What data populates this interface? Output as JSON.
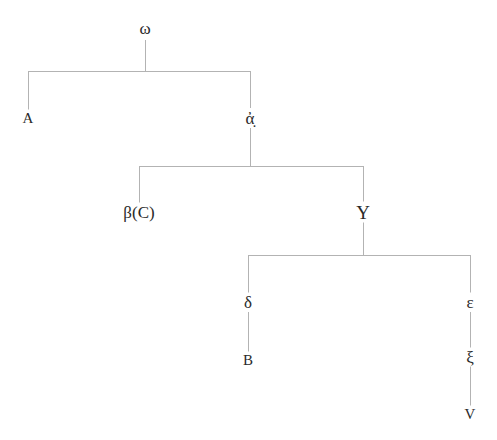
{
  "diagram": {
    "type": "tree",
    "background_color": "#ffffff",
    "line_color": "#b3b3b3",
    "text_color": "#2a2a2a",
    "width": 497,
    "height": 440
  },
  "nodes": [
    {
      "id": "omega",
      "label": "ω",
      "x": 145,
      "y": 28,
      "style": "greek-lower",
      "role": "root-archetype"
    },
    {
      "id": "A",
      "label": "A",
      "x": 28,
      "y": 118,
      "style": "latin-upper",
      "role": "witness"
    },
    {
      "id": "alpha",
      "label": "ἀ̣",
      "x": 250,
      "y": 118,
      "style": "greek-lower",
      "role": "hyparchetype"
    },
    {
      "id": "beta",
      "label": "β(C)",
      "x": 139,
      "y": 212,
      "style": "compound",
      "role": "hyparchetype-witness"
    },
    {
      "id": "upsilon",
      "label": "Υ",
      "x": 363,
      "y": 212,
      "style": "greek-upper",
      "role": "hyparchetype"
    },
    {
      "id": "delta",
      "label": "δ",
      "x": 248,
      "y": 302,
      "style": "greek-lower",
      "role": "hyparchetype"
    },
    {
      "id": "epsilon",
      "label": "ε",
      "x": 470,
      "y": 302,
      "style": "greek-lower",
      "role": "hyparchetype"
    },
    {
      "id": "B",
      "label": "B",
      "x": 248,
      "y": 360,
      "style": "latin-upper",
      "role": "witness"
    },
    {
      "id": "xi",
      "label": "ξ",
      "x": 470,
      "y": 357,
      "style": "greek-lower",
      "role": "hyparchetype"
    },
    {
      "id": "V",
      "label": "V",
      "x": 470,
      "y": 414,
      "style": "latin-upper",
      "role": "witness"
    }
  ],
  "edges": [
    {
      "id": "stem-omega",
      "kind": "vertical",
      "x": 145,
      "y1": 40,
      "y2": 71,
      "from": "omega",
      "to": "bar-1"
    },
    {
      "id": "bar-1",
      "kind": "horizontal",
      "y": 71,
      "x1": 28,
      "x2": 250,
      "from": "omega",
      "to": "A|alpha"
    },
    {
      "id": "drop-A",
      "kind": "vertical",
      "x": 28,
      "y1": 71,
      "y2": 110,
      "from": "bar-1",
      "to": "A"
    },
    {
      "id": "drop-alpha",
      "kind": "vertical",
      "x": 250,
      "y1": 71,
      "y2": 108,
      "from": "bar-1",
      "to": "alpha"
    },
    {
      "id": "stem-alpha",
      "kind": "vertical",
      "x": 250,
      "y1": 128,
      "y2": 166,
      "from": "alpha",
      "to": "bar-2"
    },
    {
      "id": "bar-2",
      "kind": "horizontal",
      "y": 166,
      "x1": 139,
      "x2": 363,
      "from": "alpha",
      "to": "beta|upsilon"
    },
    {
      "id": "drop-beta",
      "kind": "vertical",
      "x": 139,
      "y1": 166,
      "y2": 203,
      "from": "bar-2",
      "to": "beta"
    },
    {
      "id": "drop-upsilon",
      "kind": "vertical",
      "x": 363,
      "y1": 166,
      "y2": 202,
      "from": "bar-2",
      "to": "upsilon"
    },
    {
      "id": "stem-upsilon",
      "kind": "vertical",
      "x": 363,
      "y1": 222,
      "y2": 255,
      "from": "upsilon",
      "to": "bar-3"
    },
    {
      "id": "bar-3",
      "kind": "horizontal",
      "y": 255,
      "x1": 248,
      "x2": 470,
      "from": "upsilon",
      "to": "delta|epsilon"
    },
    {
      "id": "drop-delta",
      "kind": "vertical",
      "x": 248,
      "y1": 255,
      "y2": 293,
      "from": "bar-3",
      "to": "delta"
    },
    {
      "id": "drop-epsilon",
      "kind": "vertical",
      "x": 470,
      "y1": 255,
      "y2": 293,
      "from": "bar-3",
      "to": "epsilon"
    },
    {
      "id": "delta-to-B",
      "kind": "vertical",
      "x": 248,
      "y1": 312,
      "y2": 352,
      "from": "delta",
      "to": "B"
    },
    {
      "id": "epsilon-to-xi",
      "kind": "vertical",
      "x": 470,
      "y1": 312,
      "y2": 349,
      "from": "epsilon",
      "to": "xi"
    },
    {
      "id": "xi-to-V",
      "kind": "vertical",
      "x": 470,
      "y1": 366,
      "y2": 406,
      "from": "xi",
      "to": "V"
    }
  ]
}
